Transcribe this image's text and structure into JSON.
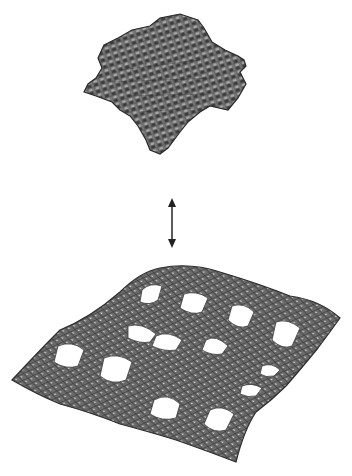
{
  "figure": {
    "top_structure": {
      "label": "",
      "shape": "compact-cubic-lattice-cluster",
      "fill_color": "#6e6e6e",
      "edge_color": "#2a2a2a",
      "highlight_color": "#b4b4b4"
    },
    "connector": {
      "label": "",
      "type": "double-headed-arrow",
      "color": "#333333"
    },
    "bottom_structure": {
      "label": "",
      "shape": "perforated-wavy-mesh-sheet",
      "grid": {
        "rows": 4,
        "cols": 4
      },
      "fill_color": "#707070",
      "edge_color": "#2e2e2e",
      "hole_color": "#ffffff"
    },
    "background_color": "#ffffff"
  }
}
